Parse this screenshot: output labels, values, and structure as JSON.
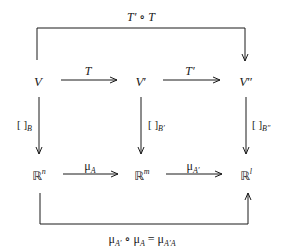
{
  "diagram": {
    "type": "commutative-diagram",
    "nodes": {
      "V": {
        "base": "V",
        "prime": ""
      },
      "V_prime": {
        "base": "V",
        "prime": "′"
      },
      "V_dprime": {
        "base": "V",
        "prime": "″"
      },
      "Rn": {
        "base": "ℝ",
        "exp": "n"
      },
      "Rm": {
        "base": "ℝ",
        "exp": "m"
      },
      "Rl": {
        "base": "ℝ",
        "exp": "l"
      }
    },
    "arrows": {
      "T": {
        "label": "T"
      },
      "T_prime": {
        "label": "T′"
      },
      "coord_B": {
        "bracket": "[ ]",
        "sub": "B"
      },
      "coord_B_prime": {
        "bracket": "[ ]",
        "sub": "B′"
      },
      "coord_B_dprime": {
        "bracket": "[ ]",
        "sub": "B″"
      },
      "mu_A": {
        "mu": "μ",
        "sub": "A"
      },
      "mu_A_prime": {
        "mu": "μ",
        "sub": "A′"
      },
      "composite_top": {
        "label": "T′ ∘ T"
      },
      "composite_bottom": {
        "mu1": "μ",
        "sub1": "A′",
        "op": " ∘ ",
        "mu2": "μ",
        "sub2": "A",
        "eq": " = ",
        "mu3": "μ",
        "sub3": "A′A"
      }
    }
  }
}
